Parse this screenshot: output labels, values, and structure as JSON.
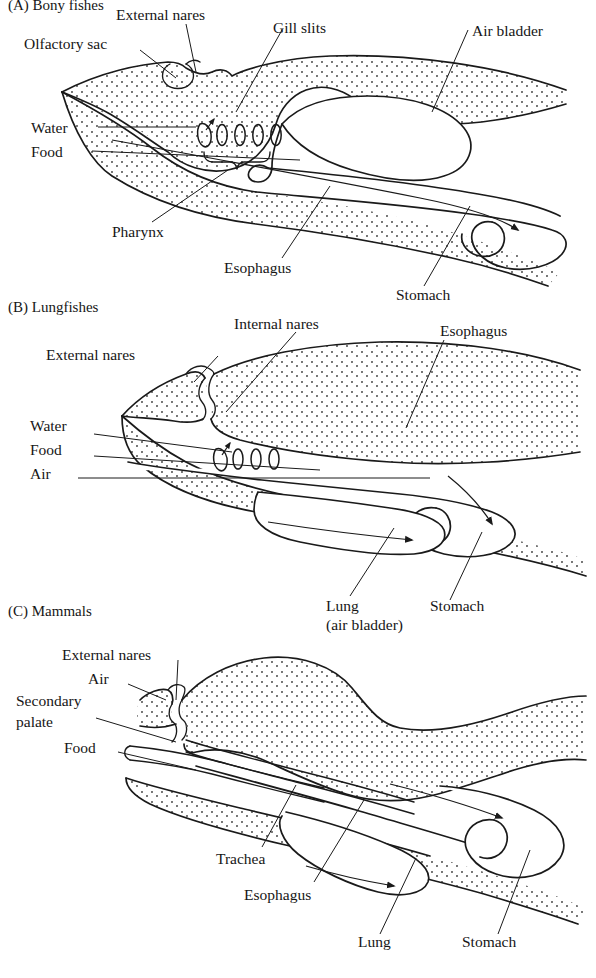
{
  "figure": {
    "caption_top": "(A) Bony fishes",
    "panels": [
      {
        "id": "A",
        "title": "(A) Bony fishes",
        "labels": [
          {
            "key": "olfactory_sac",
            "text": "Olfactory sac"
          },
          {
            "key": "external_nares",
            "text": "External nares"
          },
          {
            "key": "gill_slits",
            "text": "Gill slits"
          },
          {
            "key": "air_bladder",
            "text": "Air bladder"
          },
          {
            "key": "water",
            "text": "Water"
          },
          {
            "key": "food",
            "text": "Food"
          },
          {
            "key": "pharynx",
            "text": "Pharynx"
          },
          {
            "key": "esophagus",
            "text": "Esophagus"
          },
          {
            "key": "stomach",
            "text": "Stomach"
          }
        ]
      },
      {
        "id": "B",
        "title": "(B) Lungfishes",
        "labels": [
          {
            "key": "internal_nares",
            "text": "Internal nares"
          },
          {
            "key": "esophagus",
            "text": "Esophagus"
          },
          {
            "key": "external_nares",
            "text": "External nares"
          },
          {
            "key": "water",
            "text": "Water"
          },
          {
            "key": "food",
            "text": "Food"
          },
          {
            "key": "air",
            "text": "Air"
          },
          {
            "key": "lung_line1",
            "text": "Lung"
          },
          {
            "key": "lung_line2",
            "text": "(air bladder)"
          },
          {
            "key": "stomach",
            "text": "Stomach"
          }
        ]
      },
      {
        "id": "C",
        "title": "(C) Mammals",
        "labels": [
          {
            "key": "external_nares",
            "text": "External nares"
          },
          {
            "key": "air",
            "text": "Air"
          },
          {
            "key": "secondary_line1",
            "text": "Secondary"
          },
          {
            "key": "secondary_line2",
            "text": "palate"
          },
          {
            "key": "food",
            "text": "Food"
          },
          {
            "key": "trachea",
            "text": "Trachea"
          },
          {
            "key": "esophagus",
            "text": "Esophagus"
          },
          {
            "key": "lung",
            "text": "Lung"
          },
          {
            "key": "stomach",
            "text": "Stomach"
          }
        ]
      }
    ],
    "colors": {
      "ink": "#1a1a1a",
      "stipple": "#555555",
      "background": "#ffffff"
    }
  }
}
